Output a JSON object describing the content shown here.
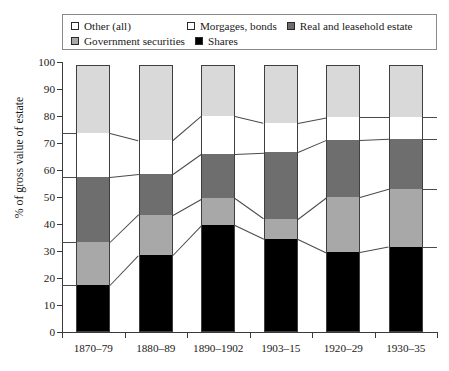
{
  "chart_data": {
    "type": "bar",
    "title": "",
    "xlabel": "",
    "ylabel": "% of gross value of estate",
    "ylim": [
      0,
      100
    ],
    "yticks": [
      0,
      10,
      20,
      30,
      40,
      50,
      60,
      70,
      80,
      90,
      100
    ],
    "grid": false,
    "stacked": true,
    "legend_position": "top",
    "categories": [
      "1870–79",
      "1880–89",
      "1890–1902",
      "1903–15",
      "1920–29",
      "1930–35"
    ],
    "series": [
      {
        "name": "Shares",
        "color": "#000000",
        "values": [
          17.4,
          28.5,
          39.5,
          34.5,
          29.5,
          31.5
        ]
      },
      {
        "name": "Government securities",
        "color": "#a8a8a8",
        "values": [
          15.9,
          15.0,
          10.0,
          7.5,
          20.5,
          21.5
        ]
      },
      {
        "name": "Real and leasehold estate",
        "color": "#6e6e6e",
        "values": [
          24.1,
          15.0,
          16.5,
          24.5,
          21.0,
          18.5
        ]
      },
      {
        "name": "Morgages, bonds",
        "color": "#ffffff",
        "values": [
          16.3,
          12.5,
          14.0,
          11.0,
          8.5,
          8.0
        ]
      },
      {
        "name": "Other (all)",
        "color": "#d9d9d9",
        "values": [
          25.3,
          28.0,
          19.0,
          21.5,
          19.5,
          19.5
        ]
      }
    ],
    "cumulative_tops": [
      [
        17.4,
        33.3,
        57.4,
        73.7,
        99.0
      ],
      [
        28.5,
        43.5,
        58.5,
        71.0,
        99.0
      ],
      [
        39.5,
        49.5,
        66.0,
        80.0,
        99.0
      ],
      [
        34.5,
        42.0,
        66.5,
        77.5,
        99.0
      ],
      [
        29.5,
        50.0,
        71.0,
        79.5,
        99.0
      ],
      [
        31.5,
        53.0,
        71.5,
        79.5,
        99.0
      ]
    ]
  },
  "legend": {
    "rows": [
      [
        {
          "label": "Other (all)",
          "swatch": "#ffffff",
          "icon": "legend-swatch-open"
        },
        {
          "label": "Morgages, bonds",
          "swatch": "#ffffff",
          "icon": "legend-swatch-open"
        },
        {
          "label": "Real and leasehold estate",
          "swatch": "#6e6e6e",
          "icon": "legend-swatch-gray"
        }
      ],
      [
        {
          "label": "Government securities",
          "swatch": "#a8a8a8",
          "icon": "legend-swatch-lightgray"
        },
        {
          "label": "Shares",
          "swatch": "#000000",
          "icon": "legend-swatch-filled"
        }
      ]
    ]
  },
  "axes": {
    "y_title": "% of gross value of estate",
    "y_ticks": [
      "100",
      "90",
      "80",
      "70",
      "60",
      "50",
      "40",
      "30",
      "20",
      "10",
      "0"
    ],
    "x_ticks": [
      "1870–79",
      "1880–89",
      "1890–1902",
      "1903–15",
      "1920–29",
      "1930–35"
    ]
  }
}
